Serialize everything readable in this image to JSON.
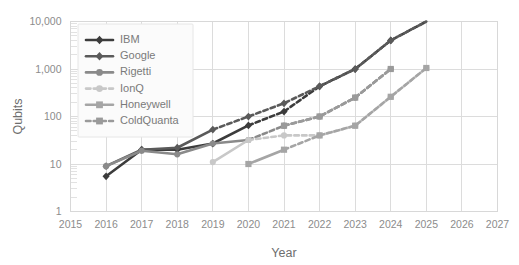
{
  "chart_data": {
    "type": "line",
    "title": "",
    "xlabel": "Year",
    "ylabel": "Qubits",
    "yscale": "log",
    "ylim": [
      1,
      10000
    ],
    "xlim": [
      2015,
      2027
    ],
    "grid": true,
    "legend_position": "top-left inside",
    "y_ticks": [
      "1",
      "10",
      "100",
      "1,000",
      "10,000"
    ],
    "y_tick_values": [
      1,
      10,
      100,
      1000,
      10000
    ],
    "x_ticks": [
      "2015",
      "2016",
      "2017",
      "2018",
      "2019",
      "2020",
      "2021",
      "2022",
      "2023",
      "2024",
      "2025",
      "2026",
      "2027"
    ],
    "x_tick_values": [
      2015,
      2016,
      2017,
      2018,
      2019,
      2020,
      2021,
      2022,
      2023,
      2024,
      2025,
      2026,
      2027
    ],
    "series": [
      {
        "name": "IBM",
        "color": "#3c3c3c",
        "marker": "diamond",
        "solid": {
          "x": [
            2016,
            2017,
            2018,
            2019,
            2020
          ],
          "y": [
            5.5,
            20,
            20,
            27,
            65
          ]
        },
        "dashed": {
          "x": [
            2020,
            2021,
            2022,
            2023,
            2024,
            2025
          ],
          "y": [
            65,
            127,
            433,
            1000,
            4000,
            10000
          ]
        }
      },
      {
        "name": "Google",
        "color": "#5a5a5a",
        "marker": "diamond",
        "solid": {
          "x": [
            2016,
            2017,
            2018,
            2019
          ],
          "y": [
            9,
            20,
            22,
            53
          ]
        },
        "dashed": {
          "x": [
            2019,
            2020,
            2021,
            2022,
            2023,
            2024,
            2025
          ],
          "y": [
            53,
            100,
            190,
            433,
            1000,
            4000,
            10000
          ]
        }
      },
      {
        "name": "Rigetti",
        "color": "#8a8a8a",
        "marker": "circle",
        "solid": {
          "x": [
            2016,
            2017,
            2018,
            2019,
            2020
          ],
          "y": [
            9,
            19,
            16,
            27,
            32
          ]
        },
        "dashed": {
          "x": [
            2020,
            2021,
            2022,
            2023,
            2024
          ],
          "y": [
            32,
            64,
            100,
            250,
            1000
          ]
        }
      },
      {
        "name": "IonQ",
        "color": "#c8c8c8",
        "marker": "circle",
        "solid": {
          "x": [
            2019,
            2020
          ],
          "y": [
            11,
            32
          ]
        },
        "dashed": {
          "x": [
            2020,
            2021,
            2022,
            2023,
            2024,
            2025
          ],
          "y": [
            32,
            40,
            40,
            64,
            260,
            1050
          ]
        }
      },
      {
        "name": "Honeywell",
        "color": "#a5a5a5",
        "marker": "square",
        "solid": {
          "x": [
            2020,
            2021
          ],
          "y": [
            10,
            20
          ]
        },
        "dashed": {
          "x": [
            2021,
            2022,
            2023,
            2024,
            2025
          ],
          "y": [
            20,
            40,
            64,
            260,
            1050
          ]
        }
      },
      {
        "name": "ColdQuanta",
        "color": "#9a9a9a",
        "marker": "square",
        "solid": {
          "x": [],
          "y": []
        },
        "dashed": {
          "x": [
            2021,
            2022,
            2023,
            2024
          ],
          "y": [
            64,
            100,
            250,
            1000
          ]
        }
      }
    ]
  },
  "legend": {
    "entries": [
      {
        "label": "IBM"
      },
      {
        "label": "Google"
      },
      {
        "label": "Rigetti"
      },
      {
        "label": "IonQ"
      },
      {
        "label": "Honeywell"
      },
      {
        "label": "ColdQuanta"
      }
    ]
  }
}
